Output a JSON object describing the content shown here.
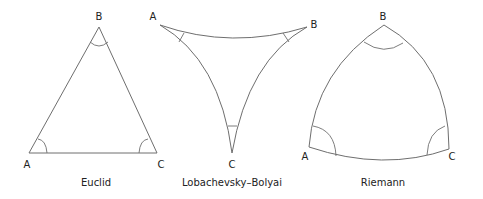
{
  "figures": [
    {
      "name": "euclid",
      "caption": "Euclid",
      "vertices": {
        "A": "A",
        "B": "B",
        "C": "C"
      }
    },
    {
      "name": "lobachevsky-bolyai",
      "caption": "Lobachevsky–Bolyai",
      "vertices": {
        "A": "A",
        "B": "B",
        "C": "C"
      }
    },
    {
      "name": "riemann",
      "caption": "Riemann",
      "vertices": {
        "A": "A",
        "B": "B",
        "C": "C"
      }
    }
  ],
  "colors": {
    "stroke": "#6e6e6e",
    "text": "#222222",
    "background": "#ffffff"
  }
}
